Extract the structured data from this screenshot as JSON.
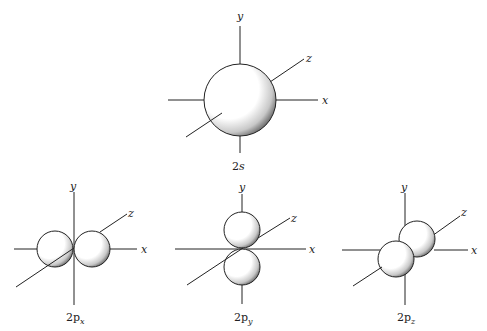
{
  "axes_labels": {
    "x": "x",
    "y": "y",
    "z": "z"
  },
  "figures": [
    {
      "id": "2s",
      "caption_main": "2",
      "caption_sub": "s",
      "shape": "sphere"
    },
    {
      "id": "2px",
      "caption_main": "2p",
      "caption_sub": "x",
      "shape": "two lobes along x"
    },
    {
      "id": "2py",
      "caption_main": "2p",
      "caption_sub": "y",
      "shape": "two lobes along y"
    },
    {
      "id": "2pz",
      "caption_main": "2p",
      "caption_sub": "z",
      "shape": "two lobes along z"
    }
  ],
  "colors": {
    "line": "#222222",
    "fill": "#ffffff",
    "shade": "#333333"
  }
}
